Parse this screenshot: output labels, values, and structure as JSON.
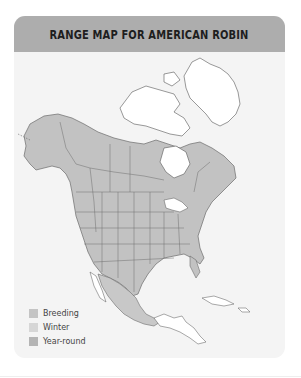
{
  "header": {
    "title": "RANGE MAP FOR AMERICAN ROBIN"
  },
  "map": {
    "region": "North America",
    "colors": {
      "breeding": "#c4c4c4",
      "winter": "#d9d9d9",
      "year_round": "#b2b2b2",
      "no_range": "#ffffff",
      "border": "#6b6b6b"
    }
  },
  "legend": {
    "items": [
      {
        "label": "Breeding",
        "color": "#c4c4c4"
      },
      {
        "label": "Winter",
        "color": "#d6d6d6"
      },
      {
        "label": "Year-round",
        "color": "#b4b4b4"
      }
    ]
  }
}
